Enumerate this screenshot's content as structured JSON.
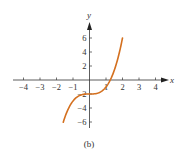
{
  "chart_data": {
    "type": "line",
    "title": "",
    "caption": "(b)",
    "xlabel": "x",
    "ylabel": "y",
    "function": "y = x^3 - 2",
    "xlim": [
      -4.5,
      4.8
    ],
    "ylim": [
      -7,
      7.5
    ],
    "x_ticks": [
      -4,
      -3,
      -2,
      -1,
      1,
      2,
      3,
      4
    ],
    "x_tick_labels": [
      "−4",
      "−3",
      "−2",
      "−1",
      "1",
      "2",
      "3",
      "4"
    ],
    "y_ticks": [
      6,
      4,
      2,
      -2,
      -4,
      -6
    ],
    "y_tick_labels": [
      "6",
      "4",
      "2",
      "−2",
      "−4",
      "−6"
    ],
    "grid": false,
    "legend": null,
    "series": [
      {
        "name": "curve",
        "color": "#d4701f",
        "x": [
          -1.59,
          -1.4,
          -1.2,
          -1.0,
          -0.8,
          -0.6,
          -0.4,
          -0.2,
          0.0,
          0.2,
          0.4,
          0.6,
          0.8,
          1.0,
          1.2,
          1.4,
          1.6,
          1.8,
          2.0
        ],
        "y": [
          -6.02,
          -4.74,
          -3.73,
          -3.0,
          -2.51,
          -2.22,
          -2.06,
          -2.01,
          -2.0,
          -1.99,
          -1.94,
          -1.78,
          -1.49,
          -1.0,
          -0.27,
          0.74,
          2.1,
          3.83,
          6.0
        ]
      }
    ]
  },
  "colors": {
    "axis": "#333333",
    "curve": "#d4701f",
    "background": "#ffffff"
  }
}
